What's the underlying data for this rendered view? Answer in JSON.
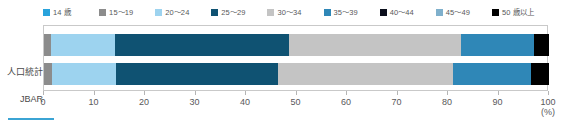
{
  "chart_data": {
    "type": "bar",
    "orientation": "horizontal",
    "stacked": true,
    "normalized_percent": true,
    "title": "",
    "subtitle": "",
    "xlabel": "",
    "ylabel": "",
    "unit_label": "(%)",
    "xlim": [
      0,
      100
    ],
    "xticks": [
      0,
      10,
      20,
      30,
      40,
      50,
      60,
      70,
      80,
      90,
      100
    ],
    "xtick_labels": [
      "0",
      "10",
      "20",
      "30",
      "40",
      "50",
      "60",
      "70",
      "80",
      "90",
      "100"
    ],
    "grid": false,
    "legend_position": "top",
    "categories": [
      "人口統計",
      "JBAR"
    ],
    "series": [
      {
        "name": "14 歳",
        "color": "#29a3dc",
        "values": [
          0.0,
          0.0
        ]
      },
      {
        "name": "15～19",
        "color": "#8c8c8c",
        "values": [
          1.4,
          1.5
        ]
      },
      {
        "name": "20～24",
        "color": "#9dd3ef",
        "values": [
          12.6,
          12.8
        ]
      },
      {
        "name": "25～29",
        "color": "#0f5272",
        "values": [
          34.5,
          32.0
        ]
      },
      {
        "name": "30～34",
        "color": "#c4c4c4",
        "values": [
          34.0,
          34.7
        ]
      },
      {
        "name": "35～39",
        "color": "#2f87b7",
        "values": [
          14.5,
          15.5
        ]
      },
      {
        "name": "40～44",
        "color": "#0b0f1c",
        "values": [
          0.0,
          0.0
        ]
      },
      {
        "name": "45～49",
        "color": "#7fb0cc",
        "values": [
          0.0,
          0.0
        ]
      },
      {
        "name": "50 歳以上",
        "color": "#000000",
        "values": [
          3.0,
          3.5
        ]
      }
    ],
    "cumulative_boundaries": {
      "人口統計": [
        1.4,
        14.0,
        48.5,
        82.5,
        97.0,
        100.0
      ],
      "JBAR": [
        1.5,
        14.3,
        46.3,
        81.0,
        96.5,
        100.0
      ]
    }
  },
  "legend": {
    "items": [
      {
        "label": "14 歳",
        "color": "#29a3dc"
      },
      {
        "label": "15～19",
        "color": "#8c8c8c"
      },
      {
        "label": "20～24",
        "color": "#9dd3ef"
      },
      {
        "label": "25～29",
        "color": "#0f5272"
      },
      {
        "label": "30～34",
        "color": "#c4c4c4"
      },
      {
        "label": "35～39",
        "color": "#2f87b7"
      },
      {
        "label": "40～44",
        "color": "#0b0f1c"
      },
      {
        "label": "45～49",
        "color": "#7fb0cc"
      },
      {
        "label": "50 歳以上",
        "color": "#000000"
      }
    ]
  },
  "axis": {
    "tick_labels": [
      "0",
      "10",
      "20",
      "30",
      "40",
      "50",
      "60",
      "70",
      "80",
      "90",
      "100"
    ],
    "unit": "(%)"
  },
  "rows": [
    {
      "label": "人口統計"
    },
    {
      "label": "JBAR"
    }
  ]
}
